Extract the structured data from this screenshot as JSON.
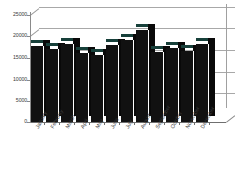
{
  "chart_data": {
    "type": "bar",
    "title": "",
    "xlabel": "",
    "ylabel": "",
    "categories": [
      "January",
      "February",
      "March",
      "April",
      "May",
      "June",
      "July",
      "August",
      "September",
      "October",
      "November",
      "December"
    ],
    "values": [
      17800,
      17000,
      18200,
      16100,
      15600,
      18000,
      19200,
      21500,
      16400,
      17300,
      16600,
      18200
    ],
    "ylim": [
      0,
      25000
    ],
    "yticks": [
      0,
      5000,
      10000,
      15000,
      20000,
      25000
    ],
    "ytick_labels": [
      "0",
      "5000",
      "10000",
      "15000",
      "20000",
      "25000"
    ],
    "grid": true,
    "legend": "none",
    "style": "3d-column",
    "bar_color": "#111111",
    "bar_top_color": "#17403a",
    "grid_color": "#a8a8a8",
    "axis_color": "#6f6f6f",
    "background": "#ffffff"
  }
}
